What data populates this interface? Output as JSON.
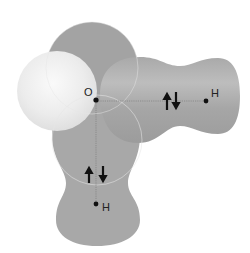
{
  "diagram": {
    "type": "molecular-orbital-diagram",
    "molecule": "water",
    "central_atom": {
      "label": "O"
    },
    "bonds": [
      {
        "name": "horizontal-bond",
        "atom_label": "H",
        "electron_pair": "↑↓"
      },
      {
        "name": "vertical-bond",
        "atom_label": "H",
        "electron_pair": "↑↓"
      }
    ],
    "colors": {
      "bonding_lobe": "#a8a8a8",
      "lone_pair_sphere": "#ececec",
      "nucleus": "#111111",
      "bond_line": "#777777"
    }
  }
}
